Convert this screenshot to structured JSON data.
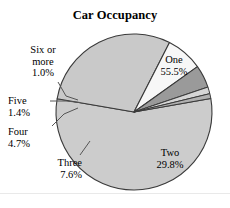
{
  "chart_data": {
    "type": "pie",
    "title": "Car Occupancy",
    "xlabel": "",
    "ylabel": "",
    "legend_position": "none",
    "grid": false,
    "categories": [
      "One",
      "Two",
      "Three",
      "Four",
      "Five",
      "Six or more"
    ],
    "values": [
      55.5,
      29.8,
      7.6,
      4.7,
      1.4,
      1.0
    ],
    "value_suffix": "%",
    "slices": [
      {
        "label": "One",
        "value": 55.5,
        "value_text": "55.5%",
        "color": "#cccccc",
        "label_placement": "inside"
      },
      {
        "label": "Two",
        "value": 29.8,
        "value_text": "29.8%",
        "color": "#c9c9c9",
        "label_placement": "inside"
      },
      {
        "label": "Three",
        "value": 7.6,
        "value_text": "7.6%",
        "color": "#f7f7f7",
        "label_placement": "outside"
      },
      {
        "label": "Four",
        "value": 4.7,
        "value_text": "4.7%",
        "color": "#9a9a9a",
        "label_placement": "outside"
      },
      {
        "label": "Five",
        "value": 1.4,
        "value_text": "1.4%",
        "color": "#d5d5d5",
        "label_placement": "outside"
      },
      {
        "label": "Six or more",
        "value": 1.0,
        "value_text": "1.0%",
        "color": "#b0b0b0",
        "label_placement": "outside"
      }
    ]
  },
  "labels": {
    "one": {
      "name": "One",
      "value": "55.5%"
    },
    "two": {
      "name": "Two",
      "value": "29.8%"
    },
    "three": {
      "name": "Three",
      "value": "7.6%"
    },
    "four": {
      "name": "Four",
      "value": "4.7%"
    },
    "five": {
      "name": "Five",
      "value": "1.4%"
    },
    "six": {
      "name_line1": "Six or",
      "name_line2": "more",
      "value": "1.0%"
    }
  },
  "colors": {
    "slice_one": "#cccccc",
    "slice_two": "#c9c9c9",
    "slice_three": "#f7f7f7",
    "slice_four": "#9a9a9a",
    "slice_five": "#d5d5d5",
    "slice_six": "#b0b0b0",
    "outline": "#3a3a3a",
    "leader": "#555555",
    "background": "#ffffff"
  }
}
